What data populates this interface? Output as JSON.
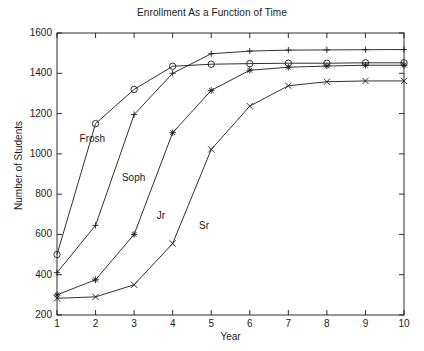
{
  "chart_data": {
    "type": "line",
    "title": "Enrollment As a Function of Time",
    "xlabel": "Year",
    "ylabel": "Number of Students",
    "x": [
      1,
      2,
      3,
      4,
      5,
      6,
      7,
      8,
      9,
      10
    ],
    "xlim": [
      1,
      10
    ],
    "ylim": [
      200,
      1600
    ],
    "xticks": [
      1,
      2,
      3,
      4,
      5,
      6,
      7,
      8,
      9,
      10
    ],
    "yticks": [
      200,
      400,
      600,
      800,
      1000,
      1200,
      1400,
      1600
    ],
    "xtick_labels": [
      "1",
      "2",
      "3",
      "4",
      "5",
      "6",
      "7",
      "8",
      "9",
      "10"
    ],
    "ytick_labels": [
      "200",
      "400",
      "600",
      "800",
      "1000",
      "1200",
      "1400",
      "1600"
    ],
    "grid": false,
    "legend": "inline-annotations",
    "line_color": "#1a1a1a",
    "series": [
      {
        "name": "Frosh",
        "marker": "circle",
        "label_x": 2.0,
        "label_y": 1075,
        "values": [
          500,
          1150,
          1320,
          1435,
          1445,
          1448,
          1450,
          1450,
          1452,
          1452
        ]
      },
      {
        "name": "Soph",
        "marker": "plus",
        "label_x": 3.1,
        "label_y": 880,
        "values": [
          410,
          645,
          1195,
          1400,
          1497,
          1510,
          1515,
          1516,
          1517,
          1518
        ]
      },
      {
        "name": "Jr",
        "marker": "star",
        "label_x": 4.0,
        "label_y": 690,
        "values": [
          300,
          375,
          600,
          1105,
          1315,
          1415,
          1430,
          1436,
          1440,
          1440
        ]
      },
      {
        "name": "Sr",
        "marker": "x",
        "label_x": 5.1,
        "label_y": 640,
        "values": [
          283,
          290,
          350,
          555,
          1022,
          1237,
          1338,
          1358,
          1362,
          1362
        ]
      }
    ]
  },
  "figure": {
    "background": "#ffffff",
    "axis_color": "#1a1a1a"
  }
}
